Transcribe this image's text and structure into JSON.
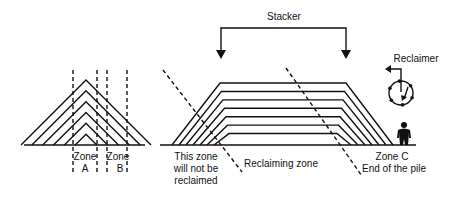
{
  "labels": {
    "stacker": "Stacker",
    "reclaimer": "Reclaimer",
    "zone_a_line1": "Zone",
    "zone_a_line2": "A",
    "zone_b_line1": "Zone",
    "zone_b_line2": "B",
    "not_reclaimed_line1": "This zone",
    "not_reclaimed_line2": "will not be",
    "not_reclaimed_line3": "reclaimed",
    "reclaiming_zone": "Reclaiming zone",
    "zone_c_line1": "Zone C",
    "zone_c_line2": "End of the pile"
  },
  "diagram": {
    "left_pile": {
      "type": "cone-shell",
      "layers": 6
    },
    "right_pile": {
      "type": "chevron",
      "layers": 7
    },
    "icons": [
      "stacker-arrow-icon",
      "reclaimer-wheel-icon",
      "person-icon"
    ]
  },
  "colors": {
    "ink": "#111111",
    "background": "#ffffff"
  }
}
